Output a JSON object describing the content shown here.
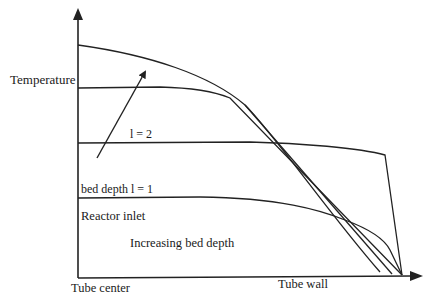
{
  "diagram": {
    "type": "temperature-profile",
    "y_axis_label": "Temperature",
    "x_axis_start_label": "Tube center",
    "x_axis_end_label": "Tube wall",
    "annotations": {
      "bed_depth_1": "bed depth  l = 1",
      "bed_depth_2": "l = 2",
      "reactor_inlet": "Reactor inlet",
      "increasing": "Increasing bed depth"
    },
    "curves": [
      {
        "name": "profile-deepest",
        "description": "Highest temperature at center, parabolic drop to wall"
      },
      {
        "name": "profile-3",
        "description": "Flat plateau then linear drop to wall"
      },
      {
        "name": "profile-l2",
        "description": "Bed depth l = 2 profile"
      },
      {
        "name": "profile-l1",
        "description": "Bed depth l = 1 / reactor inlet profile"
      }
    ],
    "arrow": {
      "meaning": "Increasing bed depth direction"
    },
    "colors": {
      "line": "#222222",
      "text": "#1a1a1a",
      "background": "#ffffff"
    }
  }
}
